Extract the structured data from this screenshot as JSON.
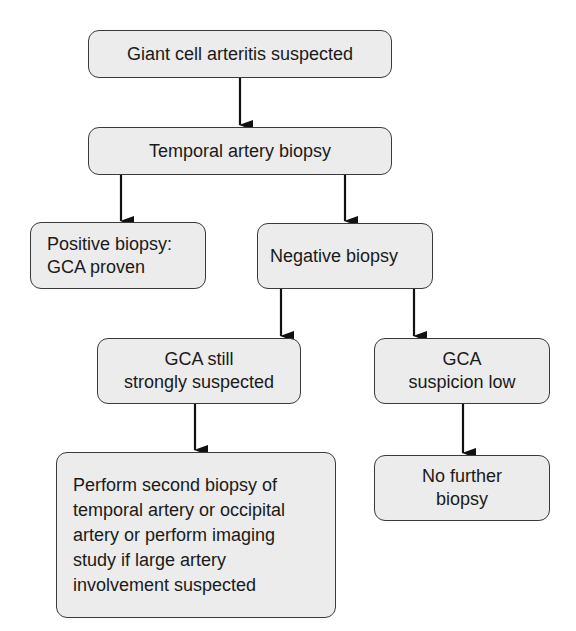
{
  "flowchart": {
    "nodes": {
      "suspected": "Giant cell arteritis suspected",
      "biopsy": "Temporal artery biopsy",
      "positive": "Positive biopsy:\nGCA proven",
      "negative": "Negative biopsy",
      "still_suspected": "GCA still\nstrongly suspected",
      "suspicion_low": "GCA\nsuspicion low",
      "second_biopsy": "Perform second biopsy of\ntemporal artery or occipital\nartery or perform imaging\nstudy if large artery\ninvolvement suspected",
      "no_further": "No further\nbiopsy"
    },
    "edges": [
      [
        "suspected",
        "biopsy"
      ],
      [
        "biopsy",
        "positive"
      ],
      [
        "biopsy",
        "negative"
      ],
      [
        "negative",
        "still_suspected"
      ],
      [
        "negative",
        "suspicion_low"
      ],
      [
        "still_suspected",
        "second_biopsy"
      ],
      [
        "suspicion_low",
        "no_further"
      ]
    ]
  }
}
